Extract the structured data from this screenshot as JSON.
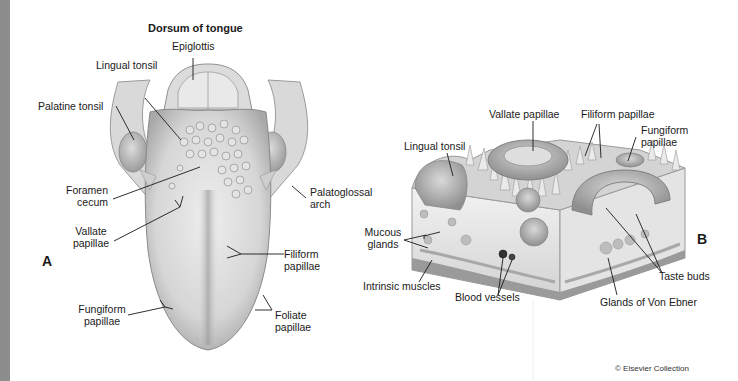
{
  "figure": {
    "panel_a": {
      "letter": "A",
      "title": "Dorsum of tongue",
      "labels": {
        "epiglottis": "Epiglottis",
        "lingual_tonsil": "Lingual tonsil",
        "palatine_tonsil": "Palatine tonsil",
        "foramen_cecum_1": "Foramen",
        "foramen_cecum_2": "cecum",
        "palatoglossal_arch_1": "Palatoglossal",
        "palatoglossal_arch_2": "arch",
        "vallate_papillae_1": "Vallate",
        "vallate_papillae_2": "papillae",
        "filiform_papillae_1": "Filiform",
        "filiform_papillae_2": "papillae",
        "fungiform_papillae_1": "Fungiform",
        "fungiform_papillae_2": "papillae",
        "foliate_papillae_1": "Foliate",
        "foliate_papillae_2": "papillae"
      }
    },
    "panel_b": {
      "letter": "B",
      "labels": {
        "vallate_papillae": "Vallate papillae",
        "filiform_papillae": "Filiform papillae",
        "fungiform_papillae_1": "Fungiform",
        "fungiform_papillae_2": "papillae",
        "lingual_tonsil": "Lingual tonsil",
        "mucous_glands_1": "Mucous",
        "mucous_glands_2": "glands",
        "intrinsic_muscles": "Intrinsic muscles",
        "blood_vessels": "Blood vessels",
        "glands_of_von_ebner": "Glands of Von Ebner",
        "taste_buds": "Taste buds"
      }
    },
    "credit": "© Elsevier Collection",
    "colors": {
      "side_bar": "#8d8d8d",
      "tissue_light": "#e6e6e6",
      "tissue_mid": "#c4c4c4",
      "tissue_dark": "#8f8f8f",
      "leader_line": "#1a1a1a"
    }
  }
}
